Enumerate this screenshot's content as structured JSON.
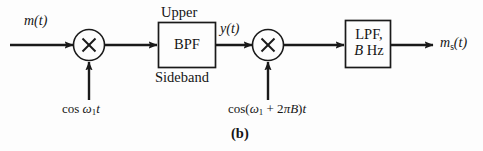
{
  "figure": {
    "part_label": "(b)",
    "caption_position": "bottom-center"
  },
  "signals": {
    "input_label": "m(t)",
    "intermediate_label": "y(t)",
    "output_label": "ms(t)",
    "output_base": "m",
    "output_sub": "s",
    "output_arg": "(t)"
  },
  "blocks": {
    "multiplier1": {
      "name": "multiplier",
      "glyph": "×",
      "cx": 89,
      "cy": 45,
      "r": 15
    },
    "multiplier2": {
      "name": "multiplier",
      "glyph": "×",
      "cx": 268,
      "cy": 45,
      "r": 15
    },
    "bandpass_filter": {
      "line1": "BPF",
      "label_above": "Upper",
      "label_below": "Sideband"
    },
    "lowpass_filter": {
      "line1": "LPF,",
      "line2_italic": "B",
      "line2_rest": " Hz"
    }
  },
  "oscillators": {
    "osc1": {
      "prefix": "cos ",
      "omega": "ω",
      "sub": "1",
      "suffix": "t"
    },
    "osc2": {
      "open": "cos(",
      "omega": "ω",
      "sub": "1",
      "mid": " + 2",
      "pi": "π",
      "bw": "B",
      "close": ")",
      "suffix": "t"
    }
  },
  "colors": {
    "background": "#fdfdfd",
    "stroke": "#1a1a1a",
    "text": "#151515"
  }
}
